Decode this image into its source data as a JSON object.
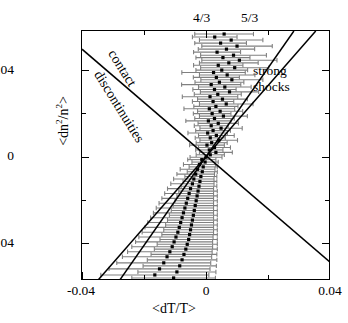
{
  "axes": {
    "x": {
      "title": "<dT/T>",
      "ticks": [
        "-0.04",
        "0",
        "0.04"
      ],
      "range": [
        -0.053,
        0.053
      ]
    },
    "y": {
      "title_pre": "<dn",
      "title_sup1": "2",
      "title_mid": "/n",
      "title_sup2": "2",
      "title_post": ">",
      "ticks": [
        "0.04",
        "0",
        "-0.04"
      ],
      "range": [
        -0.062,
        0.062
      ]
    }
  },
  "annotations": {
    "ratio_43": "4/3",
    "ratio_53": "5/3",
    "strong": "strong",
    "shocks": "shocks",
    "contact": "contact",
    "discontinuities": "discontinuities"
  },
  "colors": {
    "axis": "#000000",
    "marker": "#000000",
    "errorbar": "#808080",
    "line": "#000000",
    "background": "#ffffff"
  },
  "chart_data": {
    "type": "scatter",
    "title": "",
    "xlabel": "<dT/T>",
    "ylabel": "<dn^2/n^2>",
    "xlim": [
      -0.053,
      0.053
    ],
    "ylim": [
      -0.062,
      0.062
    ],
    "xticks": [
      -0.04,
      0,
      0.04
    ],
    "yticks": [
      -0.04,
      0,
      0.04
    ],
    "grid": false,
    "legend": null,
    "marker_style": "filled-square",
    "errorbar_orientation": "horizontal",
    "reference_lines": [
      {
        "label": "4/3",
        "slope": 1.3333,
        "intercept": 0.0,
        "note": "steep positive-slope line through origin, adiabatic index 4/3"
      },
      {
        "label": "5/3",
        "slope": 1.6667,
        "intercept": 0.0,
        "note": "steep positive-slope line through origin, adiabatic index 5/3"
      },
      {
        "label": "contact discontinuities",
        "slope": -1.0,
        "intercept": 0.0,
        "note": "negative-slope line through origin labelled along its length"
      }
    ],
    "region_labels": [
      {
        "text": "strong shocks",
        "x": 0.026,
        "y": 0.038
      },
      {
        "text": "contact discontinuities",
        "x": -0.025,
        "y": 0.03
      }
    ],
    "points": [
      {
        "x": 0.0075,
        "y": 0.0605,
        "xerr": 0.0125
      },
      {
        "x": 0.0035,
        "y": 0.059,
        "xerr": 0.0095
      },
      {
        "x": 0.0105,
        "y": 0.0575,
        "xerr": 0.0135
      },
      {
        "x": 0.006,
        "y": 0.056,
        "xerr": 0.011
      },
      {
        "x": 0.013,
        "y": 0.0545,
        "xerr": 0.015
      },
      {
        "x": 0.0085,
        "y": 0.053,
        "xerr": 0.012
      },
      {
        "x": 0.0045,
        "y": 0.0515,
        "xerr": 0.01
      },
      {
        "x": 0.0115,
        "y": 0.05,
        "xerr": 0.014
      },
      {
        "x": 0.007,
        "y": 0.0488,
        "xerr": 0.0115
      },
      {
        "x": 0.014,
        "y": 0.0475,
        "xerr": 0.016
      },
      {
        "x": 0.0095,
        "y": 0.0462,
        "xerr": 0.0125
      },
      {
        "x": 0.005,
        "y": 0.045,
        "xerr": 0.0105
      },
      {
        "x": 0.012,
        "y": 0.0438,
        "xerr": 0.0145
      },
      {
        "x": 0.0065,
        "y": 0.0426,
        "xerr": 0.011
      },
      {
        "x": 0.003,
        "y": 0.0414,
        "xerr": 0.0135
      },
      {
        "x": 0.0088,
        "y": 0.0402,
        "xerr": 0.0118
      },
      {
        "x": 0.0042,
        "y": 0.039,
        "xerr": 0.0098
      },
      {
        "x": 0.0108,
        "y": 0.0378,
        "xerr": 0.0132
      },
      {
        "x": 0.0055,
        "y": 0.0366,
        "xerr": 0.0104
      },
      {
        "x": 0.002,
        "y": 0.0354,
        "xerr": 0.0126
      },
      {
        "x": 0.0078,
        "y": 0.0342,
        "xerr": 0.0112
      },
      {
        "x": 0.0034,
        "y": 0.033,
        "xerr": 0.0092
      },
      {
        "x": 0.0098,
        "y": 0.0318,
        "xerr": 0.0124
      },
      {
        "x": 0.0048,
        "y": 0.0306,
        "xerr": 0.01
      },
      {
        "x": 0.0015,
        "y": 0.0294,
        "xerr": 0.0118
      },
      {
        "x": 0.0068,
        "y": 0.0282,
        "xerr": 0.0106
      },
      {
        "x": 0.0028,
        "y": 0.027,
        "xerr": 0.0088
      },
      {
        "x": 0.0084,
        "y": 0.0258,
        "xerr": 0.0114
      },
      {
        "x": 0.004,
        "y": 0.0246,
        "xerr": 0.0094
      },
      {
        "x": 0.0012,
        "y": 0.0234,
        "xerr": 0.0108
      },
      {
        "x": 0.0058,
        "y": 0.0222,
        "xerr": 0.0096
      },
      {
        "x": 0.0024,
        "y": 0.021,
        "xerr": 0.008
      },
      {
        "x": 0.0072,
        "y": 0.0198,
        "xerr": 0.0102
      },
      {
        "x": 0.0034,
        "y": 0.0186,
        "xerr": 0.0084
      },
      {
        "x": 0.0008,
        "y": 0.0174,
        "xerr": 0.0096
      },
      {
        "x": 0.005,
        "y": 0.0162,
        "xerr": 0.0086
      },
      {
        "x": 0.002,
        "y": 0.015,
        "xerr": 0.0072
      },
      {
        "x": 0.0062,
        "y": 0.0138,
        "xerr": 0.009
      },
      {
        "x": 0.0028,
        "y": 0.0126,
        "xerr": 0.0074
      },
      {
        "x": 0.0005,
        "y": 0.0114,
        "xerr": 0.0084
      },
      {
        "x": 0.0042,
        "y": 0.0102,
        "xerr": 0.0076
      },
      {
        "x": 0.0016,
        "y": 0.009,
        "xerr": 0.0064
      },
      {
        "x": 0.0052,
        "y": 0.0078,
        "xerr": 0.008
      },
      {
        "x": 0.0022,
        "y": 0.0066,
        "xerr": 0.0066
      },
      {
        "x": 0.0002,
        "y": 0.0054,
        "xerr": 0.0074
      },
      {
        "x": 0.0034,
        "y": 0.0042,
        "xerr": 0.0068
      },
      {
        "x": 0.0012,
        "y": 0.003,
        "xerr": 0.0058
      },
      {
        "x": 0.004,
        "y": 0.0018,
        "xerr": 0.007
      },
      {
        "x": 0.0016,
        "y": 0.0006,
        "xerr": 0.006
      },
      {
        "x": -0.0002,
        "y": -0.0006,
        "xerr": 0.0068
      },
      {
        "x": -0.002,
        "y": -0.0018,
        "xerr": 0.006
      },
      {
        "x": -0.0006,
        "y": -0.003,
        "xerr": 0.0056
      },
      {
        "x": -0.003,
        "y": -0.0042,
        "xerr": 0.0068
      },
      {
        "x": -0.0014,
        "y": -0.0054,
        "xerr": 0.006
      },
      {
        "x": -0.0038,
        "y": -0.0066,
        "xerr": 0.0074
      },
      {
        "x": -0.0018,
        "y": -0.0078,
        "xerr": 0.0064
      },
      {
        "x": -0.0046,
        "y": -0.009,
        "xerr": 0.008
      },
      {
        "x": -0.0024,
        "y": -0.0102,
        "xerr": 0.0068
      },
      {
        "x": -0.0054,
        "y": -0.0114,
        "xerr": 0.0086
      },
      {
        "x": -0.0028,
        "y": -0.0126,
        "xerr": 0.0072
      },
      {
        "x": -0.006,
        "y": -0.0138,
        "xerr": 0.0092
      },
      {
        "x": -0.0032,
        "y": -0.015,
        "xerr": 0.0076
      },
      {
        "x": -0.0068,
        "y": -0.0162,
        "xerr": 0.0098
      },
      {
        "x": -0.0036,
        "y": -0.0174,
        "xerr": 0.0082
      },
      {
        "x": -0.0074,
        "y": -0.0186,
        "xerr": 0.0104
      },
      {
        "x": -0.004,
        "y": -0.0198,
        "xerr": 0.0086
      },
      {
        "x": -0.008,
        "y": -0.021,
        "xerr": 0.011
      },
      {
        "x": -0.0044,
        "y": -0.0222,
        "xerr": 0.009
      },
      {
        "x": -0.0086,
        "y": -0.0234,
        "xerr": 0.0116
      },
      {
        "x": -0.0048,
        "y": -0.0246,
        "xerr": 0.0094
      },
      {
        "x": -0.0092,
        "y": -0.0258,
        "xerr": 0.0122
      },
      {
        "x": -0.0052,
        "y": -0.027,
        "xerr": 0.0098
      },
      {
        "x": -0.0098,
        "y": -0.0282,
        "xerr": 0.0128
      },
      {
        "x": -0.0056,
        "y": -0.0294,
        "xerr": 0.0102
      },
      {
        "x": -0.0104,
        "y": -0.0306,
        "xerr": 0.0134
      },
      {
        "x": -0.006,
        "y": -0.0318,
        "xerr": 0.0106
      },
      {
        "x": -0.011,
        "y": -0.033,
        "xerr": 0.014
      },
      {
        "x": -0.0064,
        "y": -0.0342,
        "xerr": 0.011
      },
      {
        "x": -0.0116,
        "y": -0.0354,
        "xerr": 0.0146
      },
      {
        "x": -0.0068,
        "y": -0.0366,
        "xerr": 0.0114
      },
      {
        "x": -0.0122,
        "y": -0.0378,
        "xerr": 0.0152
      },
      {
        "x": -0.0072,
        "y": -0.039,
        "xerr": 0.0118
      },
      {
        "x": -0.013,
        "y": -0.0402,
        "xerr": 0.0158
      },
      {
        "x": -0.0076,
        "y": -0.0414,
        "xerr": 0.0122
      },
      {
        "x": -0.0138,
        "y": -0.0426,
        "xerr": 0.0164
      },
      {
        "x": -0.0082,
        "y": -0.0438,
        "xerr": 0.0128
      },
      {
        "x": -0.0146,
        "y": -0.045,
        "xerr": 0.0172
      },
      {
        "x": -0.0088,
        "y": -0.0462,
        "xerr": 0.0134
      },
      {
        "x": -0.0156,
        "y": -0.0475,
        "xerr": 0.018
      },
      {
        "x": -0.0096,
        "y": -0.0488,
        "xerr": 0.014
      },
      {
        "x": -0.0168,
        "y": -0.05,
        "xerr": 0.019
      },
      {
        "x": -0.0104,
        "y": -0.0515,
        "xerr": 0.0148
      },
      {
        "x": -0.0182,
        "y": -0.053,
        "xerr": 0.02
      },
      {
        "x": -0.0114,
        "y": -0.0545,
        "xerr": 0.0156
      },
      {
        "x": -0.02,
        "y": -0.056,
        "xerr": 0.0215
      },
      {
        "x": -0.0126,
        "y": -0.0575,
        "xerr": 0.0166
      },
      {
        "x": -0.022,
        "y": -0.059,
        "xerr": 0.023
      },
      {
        "x": -0.014,
        "y": -0.0605,
        "xerr": 0.0178
      }
    ]
  }
}
